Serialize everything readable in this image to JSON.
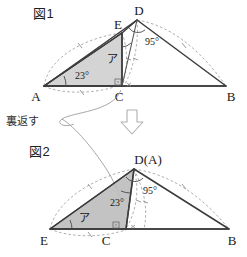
{
  "page": {
    "background_color": "#ffffff",
    "width": 247,
    "height": 257
  },
  "figure1": {
    "caption": "図1",
    "vertices": {
      "A": "A",
      "B": "B",
      "C": "C",
      "D": "D",
      "E": "E"
    },
    "angles": {
      "at_A": "23°",
      "at_D": "95°",
      "unknown": "ア"
    }
  },
  "transform_note": {
    "label": "裏返す",
    "arrow_icon": "down-arrow-icon",
    "curve_icon": "flip-curve-icon"
  },
  "figure2": {
    "caption": "図2",
    "vertices": {
      "DA": "D(A)",
      "B": "B",
      "C": "C",
      "E": "E"
    },
    "angles": {
      "at_D": "23°",
      "at_D_outer": "95°",
      "unknown": "ア"
    }
  },
  "colors": {
    "stroke": "#3c3c3c",
    "shade": "#cccccc",
    "dashed": "#9a9a9a",
    "text": "#181818"
  }
}
